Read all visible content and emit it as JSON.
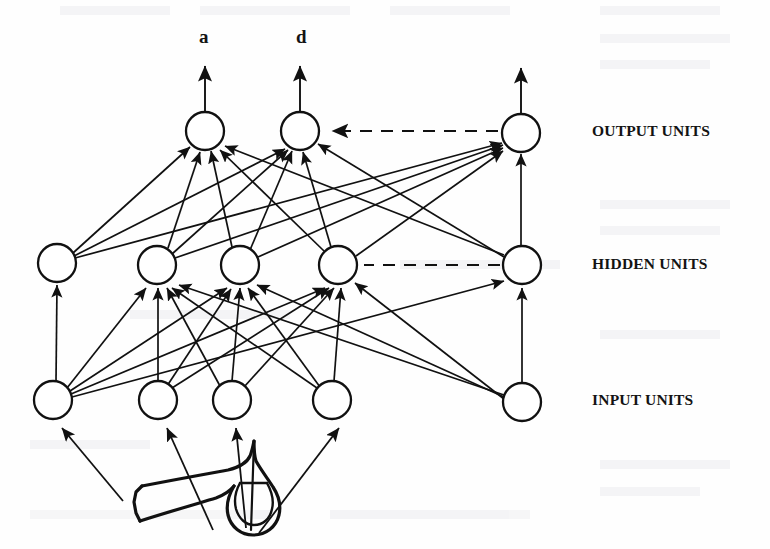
{
  "figure": {
    "background_color": "#fefefe",
    "ink_color": "#111111",
    "node_fill": "#ffffff",
    "width": 770,
    "height": 549
  },
  "labels": {
    "output_units": "OUTPUT UNITS",
    "hidden_units": "HIDDEN UNITS",
    "input_units": "INPUT UNITS",
    "output_a": "a",
    "output_d": "d"
  },
  "layers": [
    {
      "id": "output",
      "name": "OUTPUT UNITS",
      "label_position": {
        "x": 592,
        "y": 122
      },
      "node_radius": 19,
      "nodes": [
        {
          "id": "o1",
          "cx": 205,
          "cy": 131,
          "label": "a"
        },
        {
          "id": "o2",
          "cx": 300,
          "cy": 131,
          "label": "d"
        },
        {
          "id": "o3",
          "cx": 521,
          "cy": 133,
          "label": ""
        }
      ],
      "dashed_link": {
        "from": "o3",
        "to": "o2",
        "x1": 498,
        "x2": 327,
        "y": 131
      }
    },
    {
      "id": "hidden",
      "name": "HIDDEN UNITS",
      "label_position": {
        "x": 592,
        "y": 255
      },
      "node_radius": 19,
      "nodes": [
        {
          "id": "h1",
          "cx": 57,
          "cy": 263
        },
        {
          "id": "h2",
          "cx": 157,
          "cy": 265
        },
        {
          "id": "h3",
          "cx": 240,
          "cy": 265
        },
        {
          "id": "h4",
          "cx": 338,
          "cy": 265
        },
        {
          "id": "h5",
          "cx": 522,
          "cy": 265
        }
      ],
      "dashed_link": {
        "from": "h5",
        "to": "h4",
        "x1": 500,
        "x2": 362,
        "y": 265
      }
    },
    {
      "id": "input",
      "name": "INPUT UNITS",
      "label_position": {
        "x": 592,
        "y": 391
      },
      "node_radius": 19,
      "nodes": [
        {
          "id": "i1",
          "cx": 53,
          "cy": 400
        },
        {
          "id": "i2",
          "cx": 158,
          "cy": 400
        },
        {
          "id": "i3",
          "cx": 232,
          "cy": 400
        },
        {
          "id": "i4",
          "cx": 332,
          "cy": 400
        },
        {
          "id": "i5",
          "cx": 522,
          "cy": 402
        }
      ]
    }
  ],
  "output_arrows": [
    {
      "from_node": "o1",
      "x": 205,
      "y_top": 66
    },
    {
      "from_node": "o2",
      "x": 300,
      "y_top": 66
    },
    {
      "from_node": "o3",
      "x": 521,
      "y_top": 68
    }
  ],
  "connections_hidden_to_output": [
    {
      "from": "h1",
      "to": "o1"
    },
    {
      "from": "h1",
      "to": "o2"
    },
    {
      "from": "h1",
      "to": "o3"
    },
    {
      "from": "h2",
      "to": "o1"
    },
    {
      "from": "h2",
      "to": "o2"
    },
    {
      "from": "h2",
      "to": "o3"
    },
    {
      "from": "h3",
      "to": "o1"
    },
    {
      "from": "h3",
      "to": "o2"
    },
    {
      "from": "h3",
      "to": "o3"
    },
    {
      "from": "h4",
      "to": "o1"
    },
    {
      "from": "h4",
      "to": "o2"
    },
    {
      "from": "h4",
      "to": "o3"
    },
    {
      "from": "h5",
      "to": "o1"
    },
    {
      "from": "h5",
      "to": "o2"
    },
    {
      "from": "h5",
      "to": "o3"
    }
  ],
  "connections_input_to_hidden": [
    {
      "from": "i1",
      "to": "h1"
    },
    {
      "from": "i1",
      "to": "h2"
    },
    {
      "from": "i1",
      "to": "h3"
    },
    {
      "from": "i1",
      "to": "h4"
    },
    {
      "from": "i1",
      "to": "h5"
    },
    {
      "from": "i2",
      "to": "h2"
    },
    {
      "from": "i2",
      "to": "h3"
    },
    {
      "from": "i2",
      "to": "h4"
    },
    {
      "from": "i3",
      "to": "h2"
    },
    {
      "from": "i3",
      "to": "h3"
    },
    {
      "from": "i3",
      "to": "h4"
    },
    {
      "from": "i4",
      "to": "h2"
    },
    {
      "from": "i4",
      "to": "h3"
    },
    {
      "from": "i4",
      "to": "h4"
    },
    {
      "from": "i5",
      "to": "h2"
    },
    {
      "from": "i5",
      "to": "h3"
    },
    {
      "from": "i5",
      "to": "h4"
    },
    {
      "from": "i5",
      "to": "h5"
    }
  ],
  "input_arrows_from_source": [
    {
      "to_node": "i1",
      "x1": 120,
      "y1": 500,
      "x2": 62,
      "y2": 428
    },
    {
      "to_node": "i2",
      "x1": 213,
      "y1": 527,
      "x2": 167,
      "y2": 428
    },
    {
      "to_node": "i3",
      "x1": 247,
      "y1": 525,
      "x2": 236,
      "y2": 428
    },
    {
      "to_node": "i4",
      "x1": 262,
      "y1": 530,
      "x2": 339,
      "y2": 428
    }
  ],
  "source_object": {
    "name": "trumpet-drawing",
    "description": "hand-drawn trumpet / horn sketch below the input units"
  }
}
